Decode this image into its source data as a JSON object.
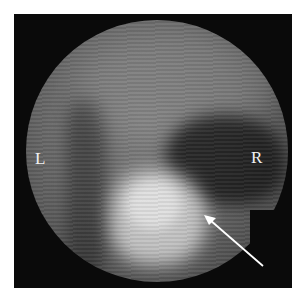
{
  "image": {
    "type": "grayscale gamma camera scintigraphy image",
    "labels": {
      "left": "L",
      "right": "R"
    },
    "annotation": {
      "type": "arrow",
      "color": "#ffffff",
      "tail": [
        263,
        266
      ],
      "tip": [
        204,
        215
      ]
    },
    "colors": {
      "background": "#ffffff",
      "frame": "#0a0a0a",
      "label": "#f2f2f2"
    }
  }
}
